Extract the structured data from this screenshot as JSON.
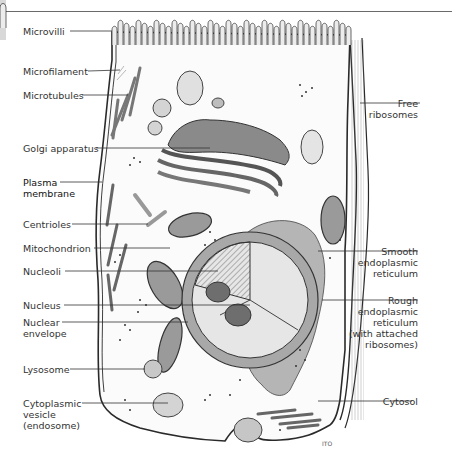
{
  "labels_left": [
    {
      "key": "microvilli",
      "text": "Microvilli"
    },
    {
      "key": "microfilament",
      "text": "Microfilament"
    },
    {
      "key": "microtubules",
      "text": "Microtubules"
    },
    {
      "key": "golgi",
      "text": "Golgi apparatus"
    },
    {
      "key": "plasma",
      "text": "Plasma\nmembrane"
    },
    {
      "key": "centrioles",
      "text": "Centrioles"
    },
    {
      "key": "mitochondrion",
      "text": "Mitochondrion"
    },
    {
      "key": "nucleoli",
      "text": "Nucleoli"
    },
    {
      "key": "nucleus",
      "text": "Nucleus"
    },
    {
      "key": "nuclear_envelope",
      "text": "Nuclear\nenvelope"
    },
    {
      "key": "lysosome",
      "text": "Lysosome"
    },
    {
      "key": "vesicle",
      "text": "Cytoplasmic\nvesicle\n(endosome)"
    }
  ],
  "labels_right": [
    {
      "key": "free_ribosomes",
      "text": "Free\nribosomes"
    },
    {
      "key": "smooth_er",
      "text": "Smooth\nendoplasmic\nreticulum"
    },
    {
      "key": "rough_er",
      "text": "Rough\nendoplasmic\nreticulum\n(with attached\nribosomes)"
    },
    {
      "key": "cytosol",
      "text": "Cytosol"
    }
  ],
  "signature": "ITO"
}
